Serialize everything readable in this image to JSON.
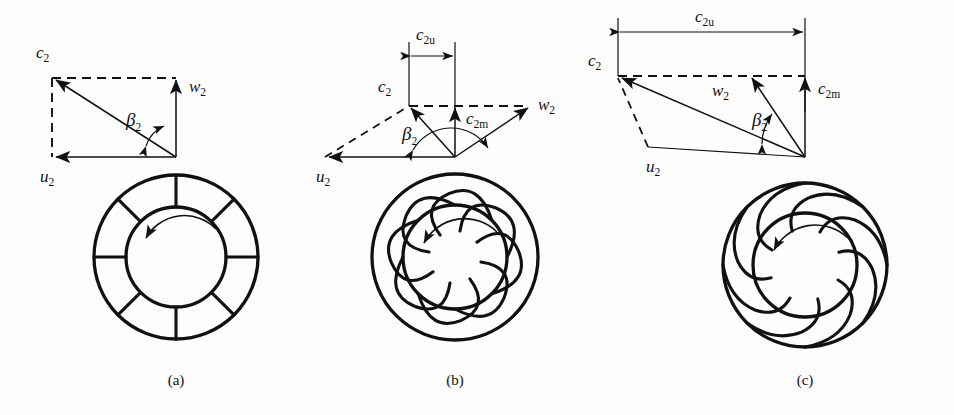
{
  "figure": {
    "background_color": "#fdfdfd",
    "line_color": "#111111",
    "panels": [
      {
        "id": "a",
        "caption": "(a)",
        "blade_type": "radial straight blades",
        "blade_count": 8,
        "rotation": "counter-clockwise",
        "labels": {
          "c2": "c",
          "c2_sub": "2",
          "w2": "w",
          "w2_sub": "2",
          "u2": "u",
          "u2_sub": "2",
          "beta2": "β",
          "beta2_sub": "2"
        },
        "has_c2u": false,
        "has_c2m": false,
        "beta2_value": "90°"
      },
      {
        "id": "b",
        "caption": "(b)",
        "blade_type": "forward-curved blades",
        "blade_count": 8,
        "rotation": "counter-clockwise",
        "labels": {
          "c2": "c",
          "c2_sub": "2",
          "w2": "w",
          "w2_sub": "2",
          "u2": "u",
          "u2_sub": "2",
          "beta2": "β",
          "beta2_sub": "2",
          "c2u": "c",
          "c2u_sub": "2u",
          "c2m": "c",
          "c2m_sub": "2m"
        },
        "has_c2u": true,
        "has_c2m": true,
        "beta2_value": ">90°"
      },
      {
        "id": "c",
        "caption": "(c)",
        "blade_type": "backward-curved blades",
        "blade_count": 8,
        "rotation": "counter-clockwise",
        "labels": {
          "c2": "c",
          "c2_sub": "2",
          "w2": "w",
          "w2_sub": "2",
          "u2": "u",
          "u2_sub": "2",
          "beta2": "β",
          "beta2_sub": "2",
          "c2u": "c",
          "c2u_sub": "2u",
          "c2m": "c",
          "c2m_sub": "2m"
        },
        "has_c2u": true,
        "has_c2m": true,
        "beta2_value": "<90°"
      }
    ]
  }
}
